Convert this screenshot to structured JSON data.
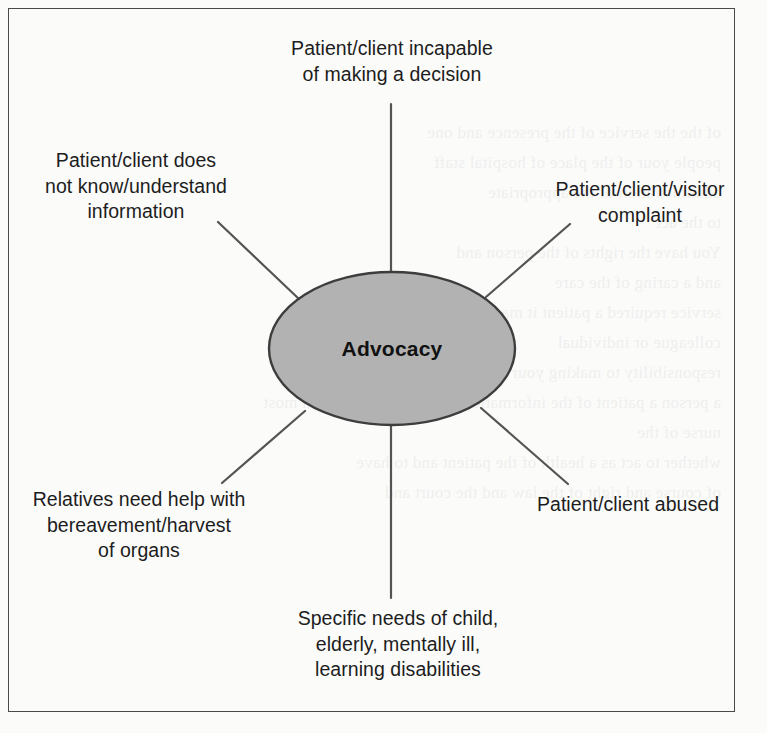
{
  "diagram": {
    "type": "spoke-diagram",
    "center": {
      "label": "Advocacy",
      "shape": "ellipse",
      "fill_color": "#b2b2b2",
      "stroke_color": "#3d3d3d"
    },
    "frame": {
      "stroke_color": "#4a4a4a"
    },
    "connector_color": "#545454",
    "nodes": [
      {
        "id": "top",
        "label": "Patient/client incapable\nof making a decision",
        "position": "top"
      },
      {
        "id": "upper-left",
        "label": "Patient/client does\nnot know/understand\ninformation",
        "position": "upper-left"
      },
      {
        "id": "upper-right",
        "label": "Patient/client/visitor\ncomplaint",
        "position": "upper-right"
      },
      {
        "id": "lower-left",
        "label": "Relatives need help with\nbereavement/harvest\nof organs",
        "position": "lower-left"
      },
      {
        "id": "lower-right",
        "label": "Patient/client abused",
        "position": "lower-right"
      },
      {
        "id": "bottom",
        "label": "Specific needs of child,\nelderly, mentally ill,\nlearning disabilities",
        "position": "bottom"
      }
    ]
  },
  "bleed_text": {
    "lines": [
      "of the the service of the presence and one",
      "people your of the place of hospital staff",
      "administration of the appropriate",
      "to the act",
      "You have the rights of the person and",
      "and a caring of the care",
      "service required a patient it may be decided by",
      "colleague or individual",
      "responsibility to making your own view. The nurses who with",
      "a person a patient of the information and decision of which most",
      "nurse of the",
      "whether to act as a health of the patient and to have",
      "of course and right of the law and the court and",
      "the responsible"
    ]
  }
}
